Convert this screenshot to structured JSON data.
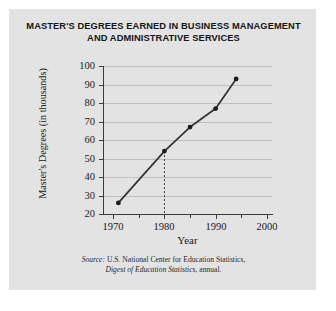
{
  "chart_data": {
    "type": "line",
    "title": "MASTER'S DEGREES EARNED IN BUSINESS MANAGEMENT AND ADMINISTRATIVE SERVICES",
    "title_line1": "MASTER'S DEGREES EARNED IN BUSINESS MANAGEMENT",
    "title_line2": "AND ADMINISTRATIVE SERVICES",
    "xlabel": "Year",
    "ylabel": "Master's Degrees (in thousands)",
    "xlim": [
      1968,
      2001
    ],
    "ylim": [
      20,
      100
    ],
    "grid": true,
    "legend": null,
    "x": [
      1971,
      1980,
      1985,
      1990,
      1994
    ],
    "values": [
      26,
      54,
      67,
      77,
      93
    ],
    "series": [
      {
        "name": "Master's Degrees (in thousands)",
        "x": [
          1971,
          1980,
          1985,
          1990,
          1994
        ],
        "values": [
          26,
          54,
          67,
          77,
          93
        ]
      }
    ],
    "xticks": [
      1970,
      1980,
      1990,
      2000
    ],
    "xtick_labels": [
      "1970",
      "1980",
      "1990",
      "2000"
    ],
    "xminor_ticks": [
      1975,
      1985,
      1995
    ],
    "yticks": [
      20,
      30,
      40,
      50,
      60,
      70,
      80,
      90,
      100
    ],
    "ytick_labels": [
      "20",
      "30",
      "40",
      "50",
      "60",
      "70",
      "80",
      "90",
      "100"
    ],
    "annotations": [
      {
        "type": "drop-line",
        "style": "dashed",
        "x": 1980,
        "y": 54,
        "description": "dashed vertical line from the 1980 data point down to the x-axis"
      }
    ],
    "colors": {
      "line": "#333333",
      "marker": "#1c1c1c",
      "grid": "#bfbfbf",
      "axis": "#3b3b3b",
      "panel_background": "#e3e3e3",
      "page_background": "#ffffff"
    }
  },
  "source": {
    "label": "Source:",
    "text": "U.S. National Center for Education Statistics,",
    "publication": "Digest of Education Statistics",
    "suffix": ", annual."
  }
}
